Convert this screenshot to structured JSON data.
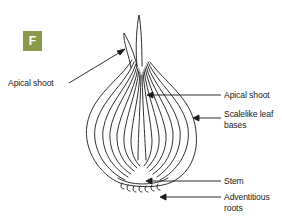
{
  "figure": {
    "panel_letter": "F",
    "badge_color": "#8a9a4b",
    "line_color": "#1a1a1a"
  },
  "labels": {
    "apical_shoot_left": "Apical shoot",
    "apical_shoot_right": "Apical shoot",
    "scalelike_line1": "Scalelike leaf",
    "scalelike_line2": "bases",
    "stem": "Stem",
    "adventitious_line1": "Adventitious",
    "adventitious_line2": "roots"
  }
}
